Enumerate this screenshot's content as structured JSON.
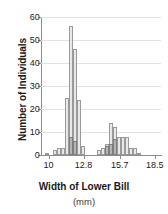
{
  "chart_data": {
    "type": "bar",
    "title": "",
    "xlabel": "Width of Lower Bill",
    "xunits": "(mm)",
    "ylabel": "Number of Individuals",
    "ylim": [
      0,
      60
    ],
    "yticks": [
      0,
      10,
      20,
      30,
      40,
      50,
      60
    ],
    "xlim": [
      9.4,
      19.0
    ],
    "xticks": [
      10,
      12.8,
      15.7,
      18.5
    ],
    "xtick_labels": [
      "10",
      "12.8",
      "15.7",
      "18.5"
    ],
    "grid": true,
    "legend": "none",
    "bin_width": 0.32,
    "series": [
      {
        "name": "light",
        "color": "#e8e8e8",
        "bins": [
          {
            "x": 9.7,
            "value": 1
          },
          {
            "x": 10.34,
            "value": 2
          },
          {
            "x": 10.66,
            "value": 3
          },
          {
            "x": 10.98,
            "value": 3
          },
          {
            "x": 11.3,
            "value": 25
          },
          {
            "x": 11.62,
            "value": 56
          },
          {
            "x": 11.94,
            "value": 46
          },
          {
            "x": 12.26,
            "value": 24
          },
          {
            "x": 12.58,
            "value": 4
          },
          {
            "x": 13.86,
            "value": 2
          },
          {
            "x": 14.18,
            "value": 3
          },
          {
            "x": 14.5,
            "value": 5
          },
          {
            "x": 14.82,
            "value": 14
          },
          {
            "x": 15.14,
            "value": 12
          },
          {
            "x": 15.46,
            "value": 8
          },
          {
            "x": 15.78,
            "value": 8
          },
          {
            "x": 16.1,
            "value": 8
          },
          {
            "x": 16.42,
            "value": 3
          },
          {
            "x": 16.74,
            "value": 3
          },
          {
            "x": 17.06,
            "value": 1
          }
        ]
      },
      {
        "name": "dark",
        "color": "#b4b4b4",
        "bins": [
          {
            "x": 11.62,
            "value": 8
          },
          {
            "x": 11.94,
            "value": 6
          },
          {
            "x": 14.5,
            "value": 4
          },
          {
            "x": 14.82,
            "value": 5
          },
          {
            "x": 15.14,
            "value": 7
          }
        ]
      }
    ]
  }
}
